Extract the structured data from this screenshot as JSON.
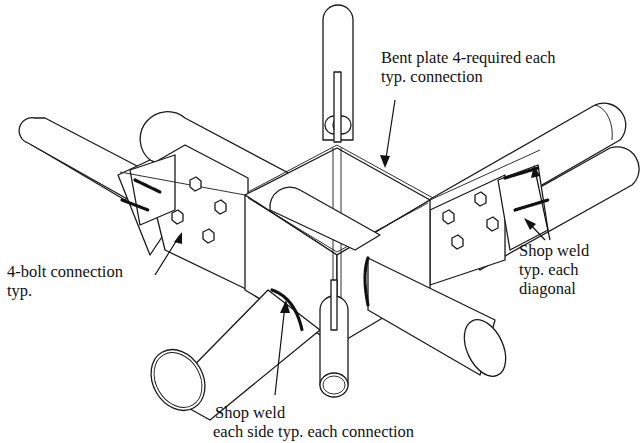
{
  "figure": {
    "type": "isometric structural connection detail",
    "background_color": "#ffffff",
    "line_color": "#1a1a1a"
  },
  "callouts": {
    "bent_plate": {
      "line1": "Bent plate 4-required each",
      "line2": "typ. connection"
    },
    "bolt_connection": {
      "line1": "4-bolt connection",
      "line2": "typ."
    },
    "shop_weld_diagonal": {
      "line1": "Shop weld",
      "line2": "typ. each",
      "line3": "diagonal"
    },
    "shop_weld_connection": {
      "line1": "Shop weld",
      "line2": "each side typ. each connection"
    }
  },
  "components": {
    "bolts_per_connection": 4,
    "bent_plates": 4,
    "members": [
      "top-vertical-tube",
      "bottom-vertical-tube",
      "left-diagonal-tube",
      "right-diagonal-tube",
      "front-left-chord",
      "front-right-chord",
      "back-left-chord",
      "back-right-chord",
      "center-tube"
    ]
  }
}
